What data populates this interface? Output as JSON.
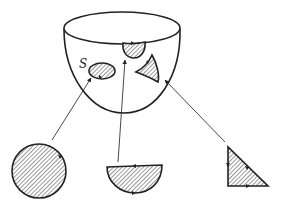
{
  "diagram": {
    "surface_label": "S",
    "colors": {
      "ink": "#222222",
      "background": "#ffffff",
      "hatch": "#555555"
    },
    "surface": {
      "rim": {
        "cx": 122,
        "cy": 28,
        "rx": 58,
        "ry": 16
      },
      "bottom_y": 113
    },
    "surface_patches": [
      {
        "name": "ellipse-patch",
        "shape": "ellipse"
      },
      {
        "name": "half-disk-patch",
        "shape": "half-disk"
      },
      {
        "name": "curved-triangle-patch",
        "shape": "curved-triangle"
      }
    ],
    "planar_regions": [
      {
        "name": "disk",
        "shape": "circle"
      },
      {
        "name": "half-disk",
        "shape": "half-disk"
      },
      {
        "name": "triangle",
        "shape": "right-triangle"
      }
    ],
    "mappings": [
      {
        "from": "disk",
        "to": "ellipse-patch"
      },
      {
        "from": "half-disk",
        "to": "half-disk-patch"
      },
      {
        "from": "triangle",
        "to": "curved-triangle-patch"
      }
    ]
  }
}
